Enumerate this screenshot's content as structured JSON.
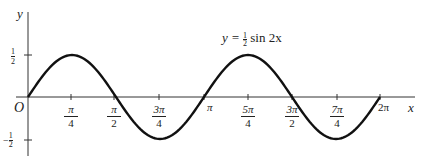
{
  "chart_data": {
    "type": "line",
    "function": "y = (1/2) sin(2x)",
    "xlabel": "x",
    "ylabel": "y",
    "origin_label": "O",
    "xlim": [
      0,
      6.2832
    ],
    "ylim": [
      -0.5,
      0.5
    ],
    "grid": false,
    "x_ticks": [
      {
        "value": 0.7854,
        "num": "π",
        "den": "4"
      },
      {
        "value": 1.5708,
        "num": "π",
        "den": "2"
      },
      {
        "value": 2.3562,
        "num": "3π",
        "den": "4"
      },
      {
        "value": 3.1416,
        "num": "π",
        "den": ""
      },
      {
        "value": 3.927,
        "num": "5π",
        "den": "4"
      },
      {
        "value": 4.7124,
        "num": "3π",
        "den": "2"
      },
      {
        "value": 5.4978,
        "num": "7π",
        "den": "4"
      },
      {
        "value": 6.2832,
        "num": "2π",
        "den": ""
      }
    ],
    "y_ticks": [
      {
        "value": 0.5,
        "label": "½"
      },
      {
        "value": -0.5,
        "label": "−½"
      }
    ],
    "x": [
      0,
      0.7854,
      1.5708,
      2.3562,
      3.1416,
      3.927,
      4.7124,
      5.4978,
      6.2832
    ],
    "values": [
      0,
      0.5,
      0,
      -0.5,
      0,
      0.5,
      0,
      -0.5,
      0
    ]
  },
  "labels": {
    "y_axis": "y",
    "x_axis": "x",
    "origin": "O",
    "equation_prefix": "y = ",
    "equation_num": "1",
    "equation_den": "2",
    "equation_suffix": " sin 2x",
    "y_pos_num": "1",
    "y_pos_den": "2",
    "y_neg_sign": "−",
    "y_neg_num": "1",
    "y_neg_den": "2",
    "pi": "π",
    "two_pi": "2π"
  }
}
